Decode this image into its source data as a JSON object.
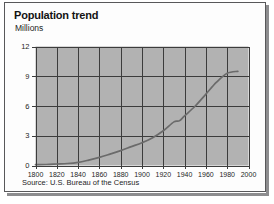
{
  "figure": {
    "title": "Population trend",
    "subtitle": "Millions",
    "source": "Source: U.S. Bureau of the Census",
    "frame_color": "#58585a",
    "background_color": "#fdfdfd",
    "plot_background_color": "#b2b2b2",
    "grid_color": "#3c3c3c",
    "line_color": "#6b6b6b"
  },
  "chart_data": {
    "type": "line",
    "title": "Population trend",
    "subtitle": "Millions",
    "xlabel": "",
    "ylabel": "Millions",
    "xlim": [
      1800,
      2000
    ],
    "ylim": [
      0,
      12
    ],
    "xticks": [
      1800,
      1820,
      1840,
      1860,
      1880,
      1900,
      1920,
      1940,
      1960,
      1980,
      2000
    ],
    "yticks": [
      0,
      3,
      6,
      9,
      12
    ],
    "xtick_labels": [
      "1800",
      "1820",
      "1840",
      "1860",
      "1880",
      "1900",
      "1920",
      "1940",
      "1960",
      "1980",
      "2000"
    ],
    "ytick_labels": [
      "0",
      "3",
      "6",
      "9",
      "12"
    ],
    "grid": true,
    "legend": false,
    "annotations": [
      "Source: U.S. Bureau of the Census"
    ],
    "x": [
      1800,
      1810,
      1820,
      1830,
      1840,
      1850,
      1860,
      1870,
      1880,
      1890,
      1900,
      1910,
      1920,
      1930,
      1935,
      1940,
      1950,
      1960,
      1970,
      1980,
      1990
    ],
    "values": [
      0.08,
      0.1,
      0.15,
      0.2,
      0.32,
      0.55,
      0.82,
      1.15,
      1.5,
      1.9,
      2.3,
      2.8,
      3.5,
      4.4,
      4.5,
      5.0,
      6.0,
      7.2,
      8.4,
      9.3,
      9.5
    ],
    "series": [
      {
        "name": "Population",
        "values": [
          0.08,
          0.1,
          0.15,
          0.2,
          0.32,
          0.55,
          0.82,
          1.15,
          1.5,
          1.9,
          2.3,
          2.8,
          3.5,
          4.4,
          4.5,
          5.0,
          6.0,
          7.2,
          8.4,
          9.3,
          9.5
        ]
      }
    ]
  }
}
